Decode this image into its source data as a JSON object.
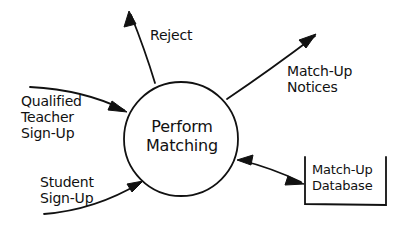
{
  "diagram": {
    "type": "data-flow-diagram",
    "process": {
      "label_line1": "Perform",
      "label_line2": "Matching"
    },
    "inputs": [
      {
        "label_line1": "Qualified",
        "label_line2": "Teacher",
        "label_line3": "Sign-Up"
      },
      {
        "label_line1": "Student",
        "label_line2": "Sign-Up"
      }
    ],
    "outputs": [
      {
        "label": "Reject"
      },
      {
        "label_line1": "Match-Up",
        "label_line2": "Notices"
      }
    ],
    "data_store": {
      "label_line1": "Match-Up",
      "label_line2": "Database",
      "flow": "bidirectional"
    },
    "colors": {
      "ink": "#111111",
      "background": "#ffffff"
    }
  }
}
